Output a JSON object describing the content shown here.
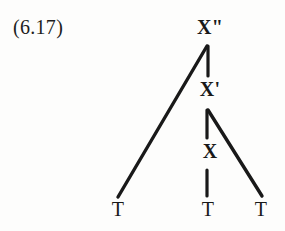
{
  "figure": {
    "example_number": "(6.17)",
    "background_color": "#fdfdfc",
    "ink_color": "#191919",
    "width": 285,
    "height": 231
  },
  "tree": {
    "nodes": {
      "x_max": {
        "label": "X\"",
        "x": 210,
        "y": 27
      },
      "x_bar": {
        "label": "X'",
        "x": 210,
        "y": 89
      },
      "x_zero": {
        "label": "X",
        "x": 210,
        "y": 151
      },
      "terminal_left": {
        "label": "T",
        "x": 118,
        "y": 209
      },
      "terminal_middle": {
        "label": "T",
        "x": 208,
        "y": 209
      },
      "terminal_right": {
        "label": "T",
        "x": 261,
        "y": 209
      }
    },
    "branches": [
      {
        "name": "x-max-to-specifier",
        "from": "x_max",
        "to": "terminal_left",
        "x1": 207,
        "y1": 46,
        "x2": 118,
        "y2": 197
      },
      {
        "name": "x-max-to-x-bar",
        "from": "x_max",
        "to": "x_bar",
        "x1": 208,
        "y1": 46,
        "x2": 208,
        "y2": 76
      },
      {
        "name": "x-bar-to-x-zero",
        "from": "x_bar",
        "to": "x_zero",
        "x1": 207,
        "y1": 110,
        "x2": 207,
        "y2": 138
      },
      {
        "name": "x-bar-to-complement",
        "from": "x_bar",
        "to": "terminal_right",
        "x1": 208,
        "y1": 110,
        "x2": 262,
        "y2": 196
      },
      {
        "name": "x-zero-to-head-terminal",
        "from": "x_zero",
        "to": "terminal_middle",
        "x1": 207,
        "y1": 170,
        "x2": 207,
        "y2": 196
      }
    ],
    "stroke_width": 3.2
  }
}
